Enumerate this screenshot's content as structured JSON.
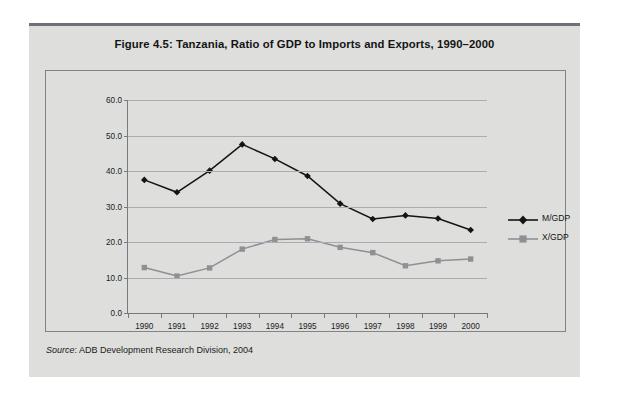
{
  "figure": {
    "title": "Figure 4.5:  Tanzania, Ratio of GDP to Imports and Exports, 1990–2000",
    "source_label": "Source",
    "source_text": ": ADB Development Research Division, 2004"
  },
  "colors": {
    "page_background": "#ffffff",
    "panel_background": "#dededc",
    "top_rule": "#6e7175",
    "frame_border": "#808387",
    "gridline": "#a9acb0",
    "axis": "#76797d",
    "series_m_gdp": "#141414",
    "series_x_gdp": "#8e9094",
    "text": "#141414"
  },
  "chart_data": {
    "type": "line",
    "title": "Figure 4.5:  Tanzania, Ratio of GDP to Imports and Exports, 1990–2000",
    "xlabel": "",
    "ylabel": "",
    "x": [
      1990,
      1991,
      1992,
      1993,
      1994,
      1995,
      1996,
      1997,
      1998,
      1999,
      2000
    ],
    "categories": [
      "1990",
      "1991",
      "1992",
      "1993",
      "1994",
      "1995",
      "1996",
      "1997",
      "1998",
      "1999",
      "2000"
    ],
    "ylim": [
      0.0,
      60.0
    ],
    "yticks": [
      0.0,
      10.0,
      20.0,
      30.0,
      40.0,
      50.0,
      60.0
    ],
    "ytick_labels": [
      "0.0",
      "10.0",
      "20.0",
      "30.0",
      "40.0",
      "50.0",
      "60.0"
    ],
    "grid": true,
    "legend_position": "right",
    "series": [
      {
        "name": "M/GDP",
        "marker": "diamond",
        "color": "#141414",
        "values": [
          37.5,
          34.0,
          40.1,
          47.5,
          43.4,
          38.6,
          30.8,
          26.5,
          27.5,
          26.6,
          23.4
        ]
      },
      {
        "name": "X/GDP",
        "marker": "square",
        "color": "#8e9094",
        "values": [
          12.8,
          10.4,
          12.7,
          18.0,
          20.7,
          20.9,
          18.5,
          17.0,
          13.3,
          14.7,
          15.2
        ]
      }
    ]
  }
}
